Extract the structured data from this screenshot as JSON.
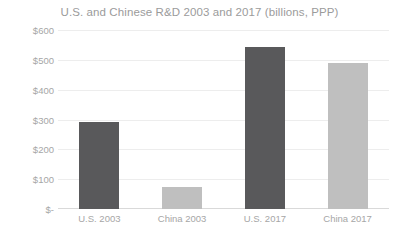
{
  "chart_data": {
    "type": "bar",
    "title": "U.S. and Chinese R&D 2003 and 2017 (billions, PPP)",
    "xlabel": "",
    "ylabel": "",
    "categories": [
      "U.S. 2003",
      "China 2003",
      "U.S. 2017",
      "China 2017"
    ],
    "values": [
      290,
      75,
      543,
      490
    ],
    "bar_colors": [
      "#59595b",
      "#bfbfbf",
      "#59595b",
      "#bfbfbf"
    ],
    "ylim": [
      0,
      600
    ],
    "ytick_values": [
      0,
      100,
      200,
      300,
      400,
      500,
      600
    ],
    "ytick_labels": [
      "$-",
      "$100",
      "$200",
      "$300",
      "$400",
      "$500",
      "$600"
    ],
    "grid": true,
    "legend": "none",
    "title_color": "#9b9b9b",
    "tick_label_color": "#a6a6a6",
    "gridline_color": "#ededed",
    "background_color": "#ffffff"
  }
}
